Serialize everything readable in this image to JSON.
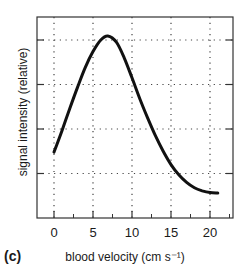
{
  "chart_data": {
    "type": "line",
    "title": "",
    "panel_label": "(c)",
    "xlabel": "blood velocity (cm s⁻¹)",
    "ylabel": "signal intensity (relative)",
    "xlim": [
      -2.2,
      22.9
    ],
    "ylim": [
      0,
      4.5
    ],
    "x_ticks": [
      0,
      5,
      10,
      15,
      20
    ],
    "x_tick_labels": [
      "0",
      "5",
      "10",
      "15",
      "20"
    ],
    "x_minor_ticks": [
      2.5,
      7.5,
      12.5,
      17.5,
      22.5
    ],
    "y_ticks": [
      1,
      2,
      3,
      4
    ],
    "y_tick_labels": [],
    "grid": true,
    "legend": null,
    "series": [
      {
        "name": "signal intensity",
        "x": [
          0,
          1,
          2,
          3,
          4,
          5,
          6,
          6.9,
          8,
          9,
          10,
          11,
          12,
          13,
          14,
          15,
          16,
          17,
          18,
          19,
          20,
          21
        ],
        "y": [
          1.48,
          1.95,
          2.45,
          2.93,
          3.38,
          3.74,
          4.0,
          4.09,
          3.95,
          3.6,
          3.15,
          2.68,
          2.25,
          1.85,
          1.5,
          1.2,
          0.97,
          0.8,
          0.68,
          0.61,
          0.57,
          0.56
        ]
      }
    ]
  }
}
